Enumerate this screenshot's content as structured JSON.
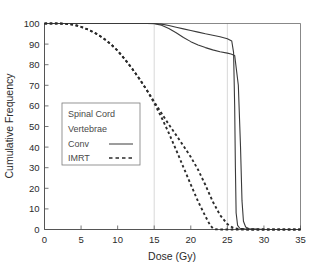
{
  "chart_data": {
    "type": "line",
    "title": "",
    "xlabel": "Dose (Gy)",
    "ylabel": "Cumulative Frequency",
    "xlim": [
      0,
      35
    ],
    "ylim": [
      0,
      100
    ],
    "xticks": [
      0,
      5,
      10,
      15,
      20,
      25,
      30,
      35
    ],
    "yticks": [
      0,
      10,
      20,
      30,
      40,
      50,
      60,
      70,
      80,
      90,
      100
    ],
    "grid": "vertical gridlines at x=15 and x=25 only",
    "gridlines_x": [
      15,
      25
    ],
    "legend_position": "center-left inside axes",
    "legend_entries": [
      {
        "label": "Spinal Cord",
        "style": "header"
      },
      {
        "label": "Vertebrae",
        "style": "header"
      },
      {
        "label": "Conv",
        "style": "solid"
      },
      {
        "label": "IMRT",
        "style": "dashed"
      }
    ],
    "series": [
      {
        "name": "Vertebrae Conv",
        "style": "solid",
        "color": "#3a3a3a",
        "points": [
          [
            0,
            100
          ],
          [
            2,
            100
          ],
          [
            4,
            100
          ],
          [
            6,
            100
          ],
          [
            8,
            100
          ],
          [
            10,
            100
          ],
          [
            12,
            100
          ],
          [
            14,
            100
          ],
          [
            15,
            100
          ],
          [
            16,
            99.7
          ],
          [
            17,
            99.0
          ],
          [
            18,
            98.2
          ],
          [
            19,
            97.4
          ],
          [
            20,
            96.6
          ],
          [
            21,
            95.8
          ],
          [
            22,
            95.0
          ],
          [
            23,
            94.3
          ],
          [
            24,
            93.6
          ],
          [
            25,
            92.6
          ],
          [
            25.6,
            91.5
          ],
          [
            25.85,
            86
          ],
          [
            26.0,
            60
          ],
          [
            26.1,
            30
          ],
          [
            26.2,
            8
          ],
          [
            26.4,
            2
          ],
          [
            26.7,
            0.6
          ],
          [
            27.5,
            0.2
          ],
          [
            30,
            0
          ],
          [
            35,
            0
          ]
        ]
      },
      {
        "name": "Spinal Cord Conv",
        "style": "solid",
        "color": "#3a3a3a",
        "points": [
          [
            0,
            100
          ],
          [
            2,
            100
          ],
          [
            4,
            100
          ],
          [
            6,
            100
          ],
          [
            8,
            100
          ],
          [
            10,
            100
          ],
          [
            12,
            100
          ],
          [
            14,
            100
          ],
          [
            15,
            99.9
          ],
          [
            16,
            99.2
          ],
          [
            17,
            97.6
          ],
          [
            18,
            95.5
          ],
          [
            19,
            93.2
          ],
          [
            20,
            91.2
          ],
          [
            21,
            89.6
          ],
          [
            22,
            88.3
          ],
          [
            23,
            87.2
          ],
          [
            24,
            86.3
          ],
          [
            25,
            85.6
          ],
          [
            25.5,
            85.2
          ],
          [
            26.0,
            84.5
          ],
          [
            26.5,
            70
          ],
          [
            26.8,
            40
          ],
          [
            27.0,
            14
          ],
          [
            27.2,
            4
          ],
          [
            27.5,
            1.2
          ],
          [
            28.0,
            0.4
          ],
          [
            30,
            0
          ],
          [
            35,
            0
          ]
        ]
      },
      {
        "name": "Vertebrae IMRT",
        "style": "dashed",
        "color": "#2b2b2b",
        "points": [
          [
            0,
            100
          ],
          [
            2,
            100
          ],
          [
            3,
            99.8
          ],
          [
            4,
            99.4
          ],
          [
            5,
            98.4
          ],
          [
            6,
            97.0
          ],
          [
            7,
            95.2
          ],
          [
            8,
            93.0
          ],
          [
            9,
            90.2
          ],
          [
            10,
            86.8
          ],
          [
            11,
            82.6
          ],
          [
            12,
            78.0
          ],
          [
            13,
            73.0
          ],
          [
            14,
            67.6
          ],
          [
            15,
            62.0
          ],
          [
            16,
            56.4
          ],
          [
            17,
            51.0
          ],
          [
            18,
            45.8
          ],
          [
            19,
            40.6
          ],
          [
            20,
            35.2
          ],
          [
            21,
            29.0
          ],
          [
            22,
            21.6
          ],
          [
            23,
            13.6
          ],
          [
            24,
            7.0
          ],
          [
            25,
            2.6
          ],
          [
            25.8,
            0.8
          ],
          [
            26.5,
            0.3
          ],
          [
            28,
            0
          ],
          [
            35,
            0
          ]
        ]
      },
      {
        "name": "Spinal Cord IMRT",
        "style": "dashed",
        "color": "#2b2b2b",
        "points": [
          [
            0,
            100
          ],
          [
            2,
            100
          ],
          [
            3,
            99.8
          ],
          [
            4,
            99.4
          ],
          [
            5,
            98.4
          ],
          [
            6,
            97.0
          ],
          [
            7,
            95.2
          ],
          [
            8,
            93.0
          ],
          [
            9,
            90.2
          ],
          [
            10,
            86.8
          ],
          [
            11,
            82.6
          ],
          [
            12,
            78.0
          ],
          [
            13,
            73.0
          ],
          [
            14,
            67.6
          ],
          [
            15,
            61.4
          ],
          [
            16,
            54.4
          ],
          [
            17,
            46.8
          ],
          [
            18,
            38.6
          ],
          [
            19,
            30.2
          ],
          [
            20,
            21.8
          ],
          [
            21,
            13.6
          ],
          [
            22,
            6.4
          ],
          [
            22.6,
            2.4
          ],
          [
            23,
            0.6
          ],
          [
            23.4,
            0.1
          ],
          [
            24,
            0
          ],
          [
            35,
            0
          ]
        ]
      }
    ]
  },
  "axes": {
    "x_title": "Dose (Gy)",
    "y_title": "Cumulative Frequency",
    "x_tick_labels": [
      "0",
      "5",
      "10",
      "15",
      "20",
      "25",
      "30",
      "35"
    ],
    "y_tick_labels": [
      "0",
      "10",
      "20",
      "30",
      "40",
      "50",
      "60",
      "70",
      "80",
      "90",
      "100"
    ]
  },
  "legend": {
    "row1": "Spinal Cord",
    "row2": "Vertebrae",
    "row3": "Conv",
    "row4": "IMRT"
  },
  "colors": {
    "axis": "#555555",
    "grid": "#cfcfcf",
    "solid_series": "#3a3a3a",
    "dashed_series": "#2b2b2b",
    "text": "#2b2b2b",
    "legend_text": "#4a4a4a",
    "legend_border": "#7a7a7a",
    "background": "#ffffff"
  }
}
